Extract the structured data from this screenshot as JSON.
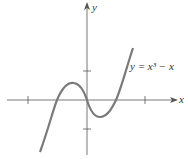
{
  "diagram": {
    "equation_label": "y = x³ − x",
    "x_axis_label": "x",
    "y_axis_label": "y",
    "x_ticks": [
      -2,
      -1,
      0,
      1,
      2
    ],
    "y_ticks": [
      -1,
      1
    ],
    "roots": [
      -1,
      0,
      1
    ],
    "colors": {
      "curve": "#7a7a7a",
      "axis": "#555555"
    }
  }
}
